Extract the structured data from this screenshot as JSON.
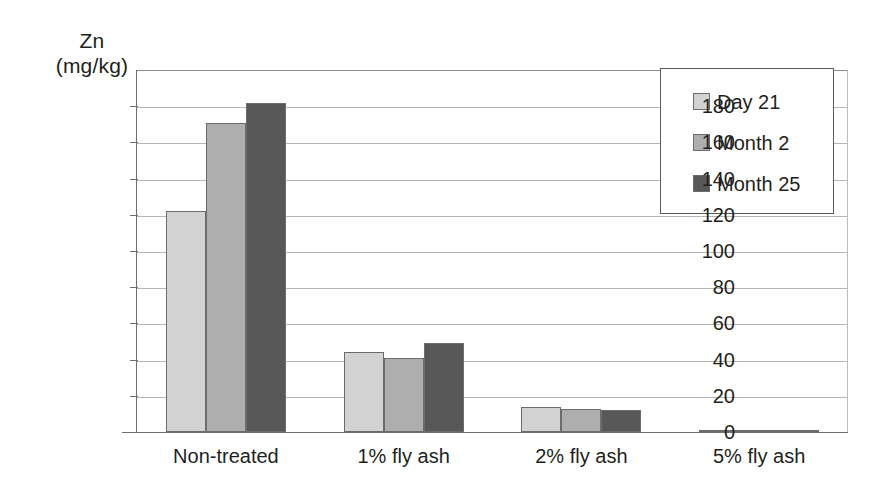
{
  "chart_data": {
    "type": "bar",
    "title": "",
    "subtitle": "",
    "xlabel": "",
    "ylabel": "Zn (mg/kg)",
    "ylabel_line1": "Zn",
    "ylabel_line2": "(mg/kg)",
    "categories": [
      "Non-treated",
      "1% fly ash",
      "2% fly ash",
      "5% fly ash"
    ],
    "series": [
      {
        "name": "Day 21",
        "color": "#d2d2d2",
        "values": [
          122,
          44,
          14,
          0.5
        ]
      },
      {
        "name": "Month 2",
        "color": "#aeaeae",
        "values": [
          171,
          41,
          12.5,
          0.5
        ]
      },
      {
        "name": "Month 25",
        "color": "#585858",
        "values": [
          182,
          49,
          12,
          1
        ]
      }
    ],
    "ylim": [
      0,
      200
    ],
    "ytick_values": [
      0,
      20,
      40,
      60,
      80,
      100,
      120,
      140,
      160,
      180
    ],
    "ytick_labels": [
      "0",
      "20",
      "40",
      "60",
      "80",
      "100",
      "120",
      "140",
      "160",
      "180"
    ],
    "grid": true,
    "grid_axis": "y",
    "legend_position": "top-right",
    "bar_border_color": "#6c6c6c",
    "axis_color": "#6f6f6f",
    "gridline_color": "#b5b5b5",
    "background": "#ffffff"
  },
  "legend": {
    "items": [
      {
        "label": "Day 21",
        "color": "#d2d2d2"
      },
      {
        "label": "Month 2",
        "color": "#aeaeae"
      },
      {
        "label": "Month 25",
        "color": "#585858"
      }
    ]
  }
}
